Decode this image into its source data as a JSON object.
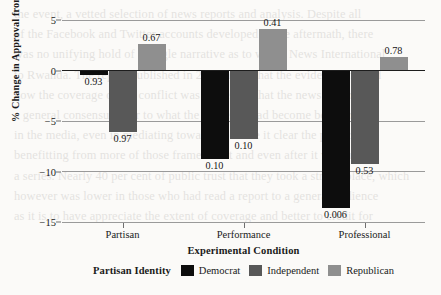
{
  "chart_data": {
    "type": "bar",
    "title": "",
    "subtitle": "",
    "xlabel": "Experimental Condition",
    "ylabel": "% Change in Approval from Control",
    "categories": [
      "Partisan",
      "Performance",
      "Professional"
    ],
    "yticks": [
      5,
      0,
      -5,
      -10,
      -15
    ],
    "ytick_labels": [
      "5",
      "0",
      "−5",
      "−10",
      "−15"
    ],
    "ylim": [
      -15,
      5
    ],
    "grid": true,
    "legend_position": "bottom",
    "legend_title": "Partisan Identity",
    "series": [
      {
        "name": "Democrat",
        "color": "#0d0d0d",
        "values": [
          -0.45,
          -8.8,
          -13.6
        ],
        "point_labels": [
          "0.93",
          "0.10",
          "0.006"
        ]
      },
      {
        "name": "Independent",
        "color": "#585858",
        "values": [
          -6.1,
          -6.8,
          -9.3
        ],
        "point_labels": [
          "0.97",
          "0.10",
          "0.53"
        ]
      },
      {
        "name": "Republican",
        "color": "#8f8f8f",
        "values": [
          2.6,
          4.1,
          1.3
        ],
        "point_labels": [
          "0.67",
          "0.41",
          "0.78"
        ]
      }
    ]
  },
  "background_text": "the small text behind is bleed-through from the reverse of the scanned page and is not part of the figure"
}
